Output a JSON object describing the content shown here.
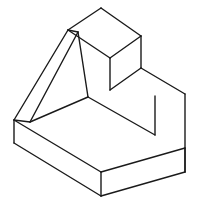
{
  "drawing": {
    "title": "Isometric Projection of Stepped Block with Angled Gusset Rib",
    "type": "isometric-line-drawing",
    "projection": "isometric",
    "line_color": "#1a1a1a",
    "fill_color": "#ffffff",
    "background_color": "#ffffff",
    "line_width": 1.4,
    "canvas": {
      "width": 198,
      "height": 205
    },
    "view_box": "0 0 198 205",
    "shading": "none",
    "hidden_lines": "omitted",
    "annotations": [],
    "dimension_labels": [],
    "vertices": {
      "top_face_back": {
        "x": 101,
        "y": 8
      },
      "top_face_left": {
        "x": 68,
        "y": 30
      },
      "top_face_right": {
        "x": 141,
        "y": 36
      },
      "top_face_front": {
        "x": 110,
        "y": 58
      },
      "upper_block_front_bottom": {
        "x": 110,
        "y": 90
      },
      "upper_block_right_bottom": {
        "x": 141,
        "y": 68
      },
      "step_back_right": {
        "x": 185,
        "y": 94
      },
      "right_upper_corner": {
        "x": 185,
        "y": 148
      },
      "cavity_inner_corner": {
        "x": 88,
        "y": 97
      },
      "cavity_right_corner": {
        "x": 155,
        "y": 135
      },
      "inner_vertical_top": {
        "x": 78,
        "y": 32
      },
      "inner_vertical_bottom": {
        "x": 88,
        "y": 97
      },
      "rib_apex": {
        "x": 68,
        "y": 30
      },
      "rib_foot": {
        "x": 30,
        "y": 122
      },
      "base_left_top": {
        "x": 14,
        "y": 120
      },
      "base_left_bottom": {
        "x": 14,
        "y": 143
      },
      "base_front_top": {
        "x": 101,
        "y": 172
      },
      "base_front_bottom": {
        "x": 101,
        "y": 196
      },
      "base_right_top": {
        "x": 185,
        "y": 148
      },
      "base_right_bottom": {
        "x": 185,
        "y": 172
      }
    },
    "edges": [
      {
        "name": "top-face-back-to-left",
        "path": "M101,8 L68,30"
      },
      {
        "name": "top-face-back-to-right",
        "path": "M101,8 L141,36"
      },
      {
        "name": "top-face-left-to-front",
        "path": "M68,30 L110,58"
      },
      {
        "name": "top-face-right-to-front",
        "path": "M141,36 L110,58"
      },
      {
        "name": "upper-block-front-vertical",
        "path": "M110,58 L110,90"
      },
      {
        "name": "upper-block-right-vertical",
        "path": "M141,36 L141,68"
      },
      {
        "name": "step-top-right-edge",
        "path": "M141,68 L185,94"
      },
      {
        "name": "step-front-edge",
        "path": "M110,90 L141,68"
      },
      {
        "name": "far-right-vertical",
        "path": "M185,94 L185,172"
      },
      {
        "name": "cavity-floor-left",
        "path": "M88,97 L30,122"
      },
      {
        "name": "cavity-floor-right",
        "path": "M88,97 L155,135"
      },
      {
        "name": "cavity-right-vertical",
        "path": "M155,135 L155,96"
      },
      {
        "name": "inner-vertical-edge",
        "path": "M78,32 L88,97"
      },
      {
        "name": "rib-top-edge",
        "path": "M68,30 L78,32"
      },
      {
        "name": "rib-slant-outer",
        "path": "M68,30 L14,120"
      },
      {
        "name": "rib-slant-inner",
        "path": "M78,32 L30,122"
      },
      {
        "name": "rib-foot-to-base-left",
        "path": "M30,122 L14,120"
      },
      {
        "name": "base-left-vertical",
        "path": "M14,120 L14,143"
      },
      {
        "name": "base-front-left-edge",
        "path": "M14,143 L101,196"
      },
      {
        "name": "base-front-right-edge",
        "path": "M101,196 L185,172"
      },
      {
        "name": "base-front-vertical",
        "path": "M101,172 L101,196"
      },
      {
        "name": "base-top-left-edge",
        "path": "M14,120 L101,172"
      },
      {
        "name": "base-top-right-edge",
        "path": "M101,172 L185,148"
      },
      {
        "name": "base-right-vertical",
        "path": "M185,148 L185,172"
      }
    ],
    "faces": [
      {
        "name": "top-face",
        "path": "M101,8 L141,36 L110,58 L68,30 Z"
      },
      {
        "name": "upper-block-front-face",
        "path": "M68,30 L110,58 L110,90 L88,97 L78,32 Z"
      },
      {
        "name": "upper-block-right-face",
        "path": "M141,36 L141,68 L110,90 L110,58 Z"
      },
      {
        "name": "step-top-face",
        "path": "M141,68 L185,94 L155,135 L110,90 Z"
      },
      {
        "name": "right-side-face",
        "path": "M185,94 L185,172 L101,196 L101,172 L185,148 Z"
      },
      {
        "name": "cavity-floor-face",
        "path": "M30,122 L88,97 L155,135 L101,172 Z"
      },
      {
        "name": "rib-outer-face",
        "path": "M68,30 L78,32 L30,122 L14,120 Z"
      },
      {
        "name": "base-front-face",
        "path": "M14,120 L14,143 L101,196 L101,172 Z"
      },
      {
        "name": "base-right-face",
        "path": "M101,172 L101,196 L185,172 L185,148 Z"
      }
    ]
  }
}
